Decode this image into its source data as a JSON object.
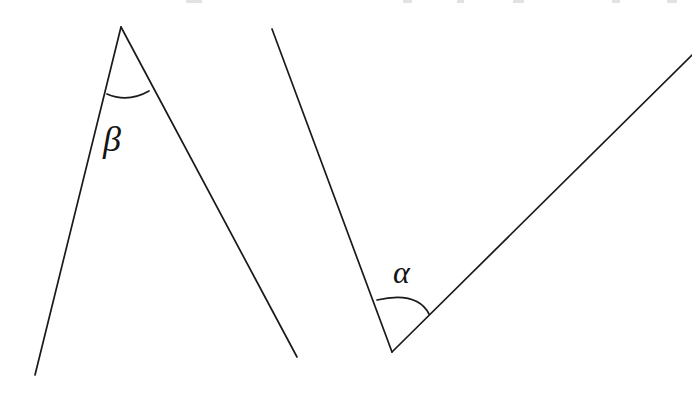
{
  "figure": {
    "type": "geometry-diagram",
    "canvas": {
      "width": 692,
      "height": 399
    },
    "background_color": "#ffffff",
    "stroke_color": "#1a1a1a",
    "stroke_width": 1.6,
    "text_color": "#141414"
  },
  "shapes": {
    "beta_figure": {
      "name": "left-angle-beta",
      "description": "Inverted-V (peak) formed by two segments meeting at a top apex",
      "apex": {
        "x": 121,
        "y": 27
      },
      "left_endpoint": {
        "x": 35,
        "y": 375
      },
      "right_endpoint": {
        "x": 297,
        "y": 357
      },
      "arc": {
        "start": {
          "x": 107,
          "y": 94
        },
        "control": {
          "x": 128,
          "y": 102
        },
        "end": {
          "x": 149,
          "y": 91
        }
      }
    },
    "alpha_figure": {
      "name": "right-angle-alpha",
      "description": "V shape formed by two rays meeting at a bottom vertex",
      "vertex": {
        "x": 392,
        "y": 352
      },
      "left_endpoint": {
        "x": 272,
        "y": 29
      },
      "right_endpoint": {
        "x": 692,
        "y": 55
      },
      "arc": {
        "start": {
          "x": 377,
          "y": 300
        },
        "control": {
          "x": 416,
          "y": 292
        },
        "end": {
          "x": 429,
          "y": 314
        }
      }
    }
  },
  "labels": {
    "beta": {
      "text": "β",
      "name": "beta",
      "x": 103,
      "y": 121
    },
    "alpha": {
      "text": "α",
      "name": "alpha",
      "x": 393,
      "y": 256
    }
  },
  "top_remnants": [
    {
      "left": 186,
      "width": 16
    },
    {
      "left": 403,
      "width": 9
    },
    {
      "left": 457,
      "width": 7
    },
    {
      "left": 513,
      "width": 11
    },
    {
      "left": 612,
      "width": 8
    },
    {
      "left": 667,
      "width": 10
    }
  ]
}
